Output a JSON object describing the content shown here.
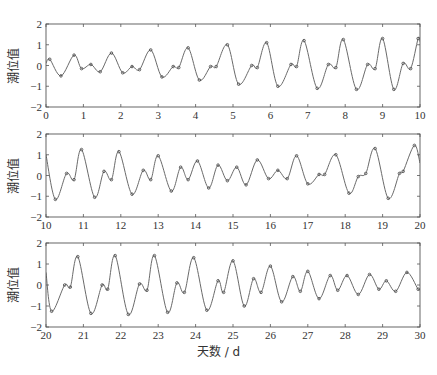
{
  "figure": {
    "xlabel": "天数 / d",
    "ylabel": "潮位值"
  },
  "chart_data": [
    {
      "type": "line",
      "title": "",
      "xlabel": "",
      "ylabel": "潮位值",
      "xlim": [
        0,
        10
      ],
      "ylim": [
        -2,
        2
      ],
      "xticks": [
        0,
        1,
        2,
        3,
        4,
        5,
        6,
        7,
        8,
        9,
        10
      ],
      "yticks": [
        -2,
        -1,
        0,
        1,
        2
      ],
      "grid": false,
      "series": [
        {
          "name": "潮位曲线",
          "style": "line+markers",
          "points": [
            [
              0.0,
              0.1
            ],
            [
              0.1,
              0.3
            ],
            [
              0.4,
              -0.5
            ],
            [
              0.75,
              0.5
            ],
            [
              0.95,
              -0.15
            ],
            [
              1.2,
              0.05
            ],
            [
              1.45,
              -0.3
            ],
            [
              1.75,
              0.6
            ],
            [
              2.05,
              -0.35
            ],
            [
              2.3,
              -0.05
            ],
            [
              2.5,
              -0.2
            ],
            [
              2.8,
              0.75
            ],
            [
              3.1,
              -0.55
            ],
            [
              3.4,
              -0.05
            ],
            [
              3.55,
              -0.1
            ],
            [
              3.8,
              0.85
            ],
            [
              4.1,
              -0.7
            ],
            [
              4.4,
              -0.05
            ],
            [
              4.55,
              -0.05
            ],
            [
              4.85,
              1.0
            ],
            [
              5.15,
              -0.9
            ],
            [
              5.5,
              0.0
            ],
            [
              5.65,
              -0.1
            ],
            [
              5.9,
              1.1
            ],
            [
              6.2,
              -1.0
            ],
            [
              6.55,
              0.05
            ],
            [
              6.7,
              -0.05
            ],
            [
              6.9,
              1.2
            ],
            [
              7.25,
              -1.1
            ],
            [
              7.55,
              0.05
            ],
            [
              7.75,
              -0.1
            ],
            [
              7.95,
              1.25
            ],
            [
              8.3,
              -1.15
            ],
            [
              8.6,
              0.05
            ],
            [
              8.8,
              -0.15
            ],
            [
              9.0,
              1.3
            ],
            [
              9.3,
              -1.15
            ],
            [
              9.55,
              0.1
            ],
            [
              9.75,
              -0.15
            ],
            [
              9.95,
              1.3
            ],
            [
              10.0,
              1.15
            ]
          ]
        }
      ]
    },
    {
      "type": "line",
      "title": "",
      "xlabel": "",
      "ylabel": "潮位值",
      "xlim": [
        10,
        20
      ],
      "ylim": [
        -2,
        2
      ],
      "xticks": [
        10,
        11,
        12,
        13,
        14,
        15,
        16,
        17,
        18,
        19,
        20
      ],
      "yticks": [
        -2,
        -1,
        0,
        1,
        2
      ],
      "grid": false,
      "series": [
        {
          "name": "潮位曲线",
          "style": "line+markers",
          "points": [
            [
              10.0,
              1.0
            ],
            [
              10.25,
              -1.15
            ],
            [
              10.55,
              0.1
            ],
            [
              10.75,
              -0.2
            ],
            [
              10.95,
              1.25
            ],
            [
              11.3,
              -1.05
            ],
            [
              11.55,
              0.2
            ],
            [
              11.75,
              -0.2
            ],
            [
              11.95,
              1.15
            ],
            [
              12.3,
              -0.9
            ],
            [
              12.6,
              0.25
            ],
            [
              12.8,
              -0.2
            ],
            [
              13.0,
              0.95
            ],
            [
              13.35,
              -0.75
            ],
            [
              13.6,
              0.4
            ],
            [
              13.8,
              -0.2
            ],
            [
              14.05,
              0.7
            ],
            [
              14.35,
              -0.6
            ],
            [
              14.6,
              0.5
            ],
            [
              14.85,
              -0.25
            ],
            [
              15.1,
              0.4
            ],
            [
              15.35,
              -0.45
            ],
            [
              15.65,
              0.75
            ],
            [
              15.95,
              -0.15
            ],
            [
              16.2,
              0.25
            ],
            [
              16.45,
              -0.15
            ],
            [
              16.7,
              0.95
            ],
            [
              17.0,
              -0.4
            ],
            [
              17.3,
              0.05
            ],
            [
              17.45,
              0.05
            ],
            [
              17.75,
              1.0
            ],
            [
              18.1,
              -0.85
            ],
            [
              18.35,
              -0.05
            ],
            [
              18.55,
              0.1
            ],
            [
              18.8,
              1.3
            ],
            [
              19.15,
              -1.1
            ],
            [
              19.45,
              0.1
            ],
            [
              19.55,
              0.2
            ],
            [
              19.85,
              1.45
            ],
            [
              20.0,
              0.6
            ]
          ]
        }
      ]
    },
    {
      "type": "line",
      "title": "",
      "xlabel": "天数 / d",
      "ylabel": "潮位值",
      "xlim": [
        20,
        30
      ],
      "ylim": [
        -2,
        2
      ],
      "xticks": [
        20,
        21,
        22,
        23,
        24,
        25,
        26,
        27,
        28,
        29,
        30
      ],
      "yticks": [
        -2,
        -1,
        0,
        1,
        2
      ],
      "grid": false,
      "series": [
        {
          "name": "潮位曲线",
          "style": "line+markers",
          "points": [
            [
              20.0,
              0.6
            ],
            [
              20.15,
              -1.25
            ],
            [
              20.5,
              0.0
            ],
            [
              20.65,
              -0.1
            ],
            [
              20.85,
              1.35
            ],
            [
              21.2,
              -1.35
            ],
            [
              21.5,
              0.0
            ],
            [
              21.65,
              -0.2
            ],
            [
              21.85,
              1.4
            ],
            [
              22.2,
              -1.4
            ],
            [
              22.5,
              0.05
            ],
            [
              22.7,
              -0.25
            ],
            [
              22.9,
              1.4
            ],
            [
              23.25,
              -1.3
            ],
            [
              23.5,
              0.1
            ],
            [
              23.7,
              -0.35
            ],
            [
              23.95,
              1.3
            ],
            [
              24.3,
              -1.2
            ],
            [
              24.6,
              0.2
            ],
            [
              24.75,
              -0.35
            ],
            [
              25.0,
              1.15
            ],
            [
              25.3,
              -1.0
            ],
            [
              25.55,
              0.3
            ],
            [
              25.75,
              -0.35
            ],
            [
              26.0,
              0.9
            ],
            [
              26.3,
              -0.8
            ],
            [
              26.6,
              0.4
            ],
            [
              26.8,
              -0.3
            ],
            [
              27.0,
              0.65
            ],
            [
              27.3,
              -0.65
            ],
            [
              27.6,
              0.45
            ],
            [
              27.8,
              -0.25
            ],
            [
              28.05,
              0.45
            ],
            [
              28.35,
              -0.45
            ],
            [
              28.65,
              0.5
            ],
            [
              28.9,
              -0.2
            ],
            [
              29.1,
              0.2
            ],
            [
              29.35,
              -0.3
            ],
            [
              29.65,
              0.6
            ],
            [
              29.95,
              -0.2
            ],
            [
              30.0,
              -0.15
            ]
          ]
        }
      ]
    }
  ],
  "layout": {
    "panels": [
      {
        "left": 46,
        "top": 24,
        "right": 420,
        "bottom": 107
      },
      {
        "left": 46,
        "top": 134,
        "right": 420,
        "bottom": 217
      },
      {
        "left": 46,
        "top": 243,
        "right": 420,
        "bottom": 327
      }
    ],
    "colors": {
      "axis": "#555555",
      "line": "#6a6a6a",
      "marker": "#444444"
    }
  }
}
